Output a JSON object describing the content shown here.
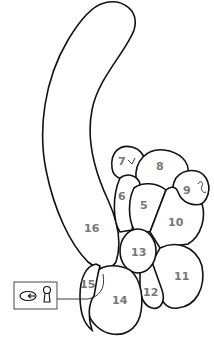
{
  "diagram": {
    "type": "balloon-twist-parts",
    "colors": {
      "outline": "#111111",
      "label": "#777777",
      "background": "#ffffff"
    },
    "parts": [
      {
        "id": "5",
        "label": "5"
      },
      {
        "id": "6",
        "label": "6"
      },
      {
        "id": "7",
        "label": "7"
      },
      {
        "id": "8",
        "label": "8"
      },
      {
        "id": "9",
        "label": "9"
      },
      {
        "id": "10",
        "label": "10"
      },
      {
        "id": "11",
        "label": "11"
      },
      {
        "id": "12",
        "label": "12"
      },
      {
        "id": "13",
        "label": "13"
      },
      {
        "id": "14",
        "label": "14"
      },
      {
        "id": "15",
        "label": "15"
      },
      {
        "id": "16",
        "label": "16"
      }
    ],
    "legend_box": {
      "icons": [
        "twist-arrow-icon",
        "lock-twist-icon"
      ]
    }
  }
}
